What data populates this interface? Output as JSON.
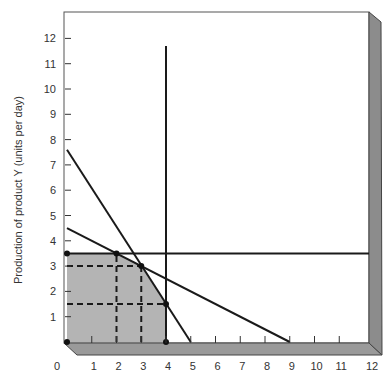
{
  "chart_data": {
    "type": "line",
    "title": "",
    "xlabel": "",
    "ylabel": "Production of product Y (units per day)",
    "xlim": [
      0,
      12
    ],
    "ylim": [
      0,
      12
    ],
    "x_ticks": [
      "0",
      "1",
      "2",
      "3",
      "4",
      "5",
      "6",
      "7",
      "8",
      "9",
      "10",
      "11",
      "12"
    ],
    "y_ticks": [
      "1",
      "2",
      "3",
      "4",
      "5",
      "6",
      "7",
      "8",
      "9",
      "10",
      "11",
      "12"
    ],
    "grid": false,
    "legend": null,
    "series": [
      {
        "name": "constraint-line-steep",
        "points": [
          [
            0,
            7.6
          ],
          [
            5,
            0
          ]
        ]
      },
      {
        "name": "constraint-line-shallow",
        "points": [
          [
            0,
            4.5
          ],
          [
            9,
            0
          ]
        ]
      },
      {
        "name": "constraint-horizontal",
        "points": [
          [
            0,
            3.5
          ],
          [
            12,
            3.5
          ]
        ]
      },
      {
        "name": "constraint-vertical",
        "points": [
          [
            4,
            0
          ],
          [
            4,
            11.7
          ]
        ]
      }
    ],
    "feasible_region": [
      [
        0,
        0
      ],
      [
        0,
        3.5
      ],
      [
        2,
        3.5
      ],
      [
        3,
        3
      ],
      [
        4,
        1.5
      ],
      [
        4,
        0
      ]
    ],
    "corner_points": [
      [
        0,
        0
      ],
      [
        0,
        3.5
      ],
      [
        2,
        3.5
      ],
      [
        3,
        3
      ],
      [
        4,
        1.5
      ],
      [
        4,
        0
      ]
    ],
    "dashed_guides": [
      {
        "from": [
          0,
          3
        ],
        "to": [
          3,
          3
        ]
      },
      {
        "from": [
          0,
          1.5
        ],
        "to": [
          4,
          1.5
        ]
      },
      {
        "from": [
          2,
          0
        ],
        "to": [
          2,
          3.5
        ]
      },
      {
        "from": [
          3,
          0
        ],
        "to": [
          3,
          3
        ]
      }
    ],
    "colors": {
      "feasible_fill": "#b4b4b4",
      "floor_panel": "#9a9a9a",
      "side_panel": "#8c8c8c",
      "line": "#1a1a1a"
    }
  }
}
